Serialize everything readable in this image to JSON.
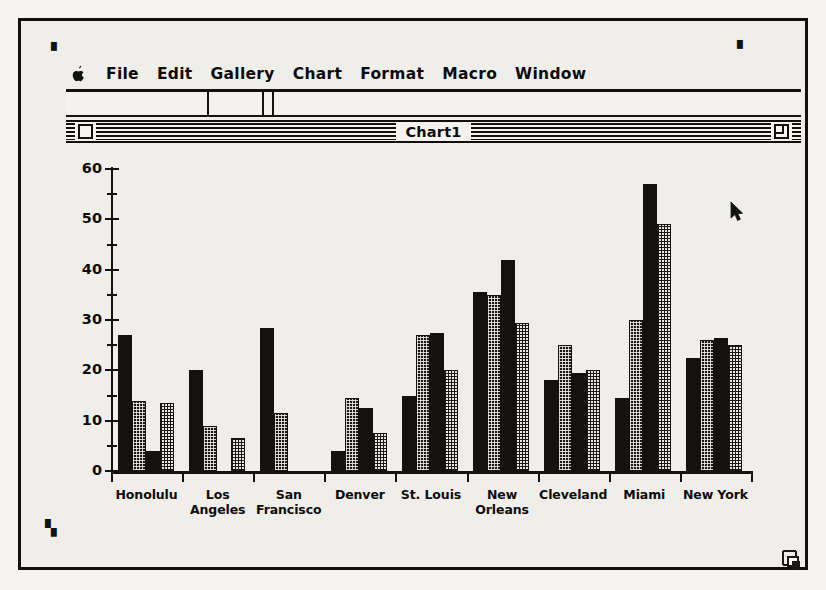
{
  "window": {
    "title": "Chart1",
    "close_box": "close-box",
    "zoom_box": "zoom-box"
  },
  "menubar": {
    "items": [
      {
        "label": "",
        "name": "apple-menu"
      },
      {
        "label": "File",
        "name": "file-menu"
      },
      {
        "label": "Edit",
        "name": "edit-menu"
      },
      {
        "label": "Gallery",
        "name": "gallery-menu"
      },
      {
        "label": "Chart",
        "name": "chart-menu"
      },
      {
        "label": "Format",
        "name": "format-menu"
      },
      {
        "label": "Macro",
        "name": "macro-menu"
      },
      {
        "label": "Window",
        "name": "window-menu"
      }
    ]
  },
  "colors": {
    "ink": "#14120f",
    "paper": "#efeeea",
    "series1": "#14120f",
    "series2": "#1a1816",
    "series3": "#14120f",
    "series4": "#e9e8e3"
  },
  "chart_data": {
    "type": "bar",
    "title": "",
    "xlabel": "",
    "ylabel": "",
    "ylim": [
      0,
      60
    ],
    "yticks": [
      0,
      10,
      20,
      30,
      40,
      50,
      60
    ],
    "ytick_minor_step": 5,
    "grid": false,
    "legend": "none",
    "categories": [
      "Honolulu",
      "Los\nAngeles",
      "San\nFrancisco",
      "Denver",
      "St. Louis",
      "New\nOrleans",
      "Cleveland",
      "Miami",
      "New York"
    ],
    "series": [
      {
        "name": "Series 1",
        "pattern": "solid",
        "values": [
          27,
          20,
          28.5,
          4,
          15,
          35.5,
          18,
          14.5,
          22.5
        ]
      },
      {
        "name": "Series 2",
        "pattern": "dark-stipple",
        "values": [
          14,
          9,
          11.5,
          14.5,
          27,
          35,
          25,
          30,
          26
        ]
      },
      {
        "name": "Series 3",
        "pattern": "solid",
        "values": [
          4,
          0,
          0,
          12.5,
          27.5,
          42,
          19.5,
          57,
          26.5
        ]
      },
      {
        "name": "Series 4",
        "pattern": "light-stipple",
        "values": [
          13.5,
          6.5,
          0,
          7.5,
          20,
          29.5,
          20,
          49,
          25
        ]
      }
    ]
  },
  "cursor": {
    "name": "arrow-cursor",
    "x": 709,
    "y": 180
  },
  "growbox": {
    "name": "grow-box"
  }
}
